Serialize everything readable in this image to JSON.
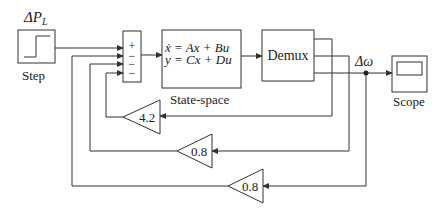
{
  "diagram": {
    "type": "simulink-block-diagram",
    "blocks": {
      "step": {
        "label": "Step",
        "signal_label": "ΔP",
        "signal_sub": "L"
      },
      "sum": {
        "signs": [
          "+",
          "−",
          "−",
          "−"
        ]
      },
      "state_space": {
        "label": "State-space",
        "eq1": "ẋ = Ax + Bu",
        "eq2": "y = Cx + Du"
      },
      "demux": {
        "label": "Demux"
      },
      "scope": {
        "label": "Scope"
      },
      "gain1": {
        "value": "4.2"
      },
      "gain2": {
        "value": "0.8"
      },
      "gain3": {
        "value": "0.8"
      }
    },
    "signals": {
      "output": {
        "label": "Δω"
      }
    }
  },
  "colors": {
    "line": "#333333",
    "background": "#ffffff"
  }
}
